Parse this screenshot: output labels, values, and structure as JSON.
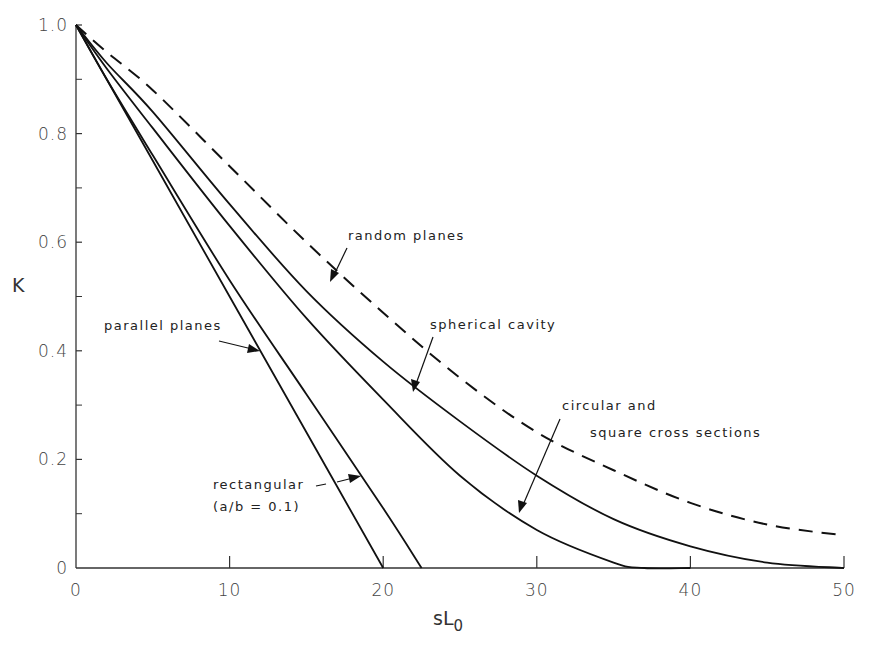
{
  "chart_data": {
    "type": "line",
    "title": "",
    "xlabel": "sL",
    "xlabel_subscript": "0",
    "ylabel": "K",
    "xlim": [
      0,
      50
    ],
    "ylim": [
      0,
      1.0
    ],
    "grid": false,
    "legend": "inline annotations with arrows",
    "x_ticks": [
      0,
      10,
      20,
      30,
      40,
      50
    ],
    "x_tick_labels": [
      "0",
      "10",
      "20",
      "30",
      "40",
      "50"
    ],
    "y_ticks": [
      0,
      0.2,
      0.4,
      0.6,
      0.8,
      1.0
    ],
    "y_tick_labels": [
      "0",
      "0.2",
      "0.4",
      "0.6",
      "0.8",
      "1.0"
    ],
    "y_minor_ticks": [
      0.1,
      0.3,
      0.5,
      0.7,
      0.9
    ],
    "series": [
      {
        "name": "parallel planes",
        "style": "solid",
        "x": [
          0,
          5,
          10,
          15,
          20
        ],
        "y": [
          1.0,
          0.75,
          0.5,
          0.25,
          0.0
        ]
      },
      {
        "name": "rectangular (a/b = 0.1)",
        "style": "solid",
        "x": [
          0,
          2,
          5,
          10,
          15,
          20,
          22.5
        ],
        "y": [
          1.0,
          0.9,
          0.76,
          0.53,
          0.32,
          0.11,
          0.0
        ]
      },
      {
        "name": "circular and square cross sections",
        "style": "solid",
        "x": [
          0,
          2,
          5,
          10,
          15,
          20,
          25,
          30,
          35,
          37,
          40
        ],
        "y": [
          1.0,
          0.92,
          0.81,
          0.63,
          0.46,
          0.31,
          0.17,
          0.07,
          0.01,
          0.0,
          0.0
        ]
      },
      {
        "name": "spherical cavity",
        "style": "solid",
        "x": [
          0,
          2,
          5,
          10,
          15,
          20,
          25,
          30,
          35,
          40,
          45,
          50
        ],
        "y": [
          1.0,
          0.93,
          0.84,
          0.67,
          0.51,
          0.38,
          0.27,
          0.17,
          0.09,
          0.04,
          0.01,
          0.0
        ]
      },
      {
        "name": "random planes",
        "style": "dashed",
        "x": [
          0,
          2,
          5,
          10,
          15,
          20,
          25,
          30,
          35,
          40,
          45,
          50
        ],
        "y": [
          1.0,
          0.95,
          0.88,
          0.74,
          0.6,
          0.47,
          0.35,
          0.25,
          0.18,
          0.12,
          0.08,
          0.06
        ]
      }
    ],
    "annotations": [
      {
        "text": "random planes",
        "target_series": "random planes"
      },
      {
        "text": "spherical cavity",
        "target_series": "spherical cavity"
      },
      {
        "text": "parallel planes",
        "target_series": "parallel planes"
      },
      {
        "text": "circular and",
        "text2": "square cross sections",
        "target_series": "circular and square cross sections"
      },
      {
        "text": "rectangular",
        "text2": "(a/b = 0.1)",
        "target_series": "rectangular (a/b = 0.1)"
      }
    ]
  },
  "labels": {
    "y_axis": "K",
    "x_axis_main": "sL",
    "x_axis_sub": "0",
    "ann_random": "random planes",
    "ann_spherical": "spherical cavity",
    "ann_parallel": "parallel planes",
    "ann_circular_1": "circular and",
    "ann_circular_2": "square cross sections",
    "ann_rect_1": "rectangular",
    "ann_rect_2": "(a/b = 0.1)"
  }
}
